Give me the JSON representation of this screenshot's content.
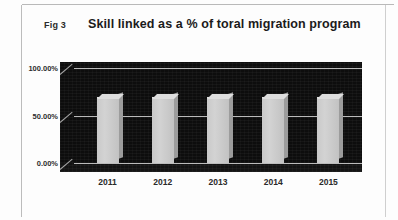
{
  "figure": {
    "label": "Fig 3",
    "title": "Skill linked as a % of toral migration program"
  },
  "colors": {
    "plot_background": "#0d0d0d",
    "bar_fill": "#c9c9c9",
    "bar_side": "#9c9c9c",
    "gridline": "#d9d9d9",
    "text": "#2a2a2a",
    "page_background": "#fdfdfd",
    "frame_rule": "#bcbcbc"
  },
  "chart_data": {
    "type": "bar",
    "title": "Skill linked as a % of toral migration program",
    "xlabel": "",
    "ylabel": "",
    "categories": [
      "2011",
      "2012",
      "2013",
      "2014",
      "2015"
    ],
    "values": [
      68,
      68,
      68,
      68,
      68
    ],
    "ylim": [
      0,
      100
    ],
    "yticks": [
      0,
      50,
      100
    ],
    "ytick_labels": [
      "0.00%",
      "50.00%",
      "100.00%"
    ],
    "grid": true,
    "legend": "none",
    "style_3d": true
  }
}
